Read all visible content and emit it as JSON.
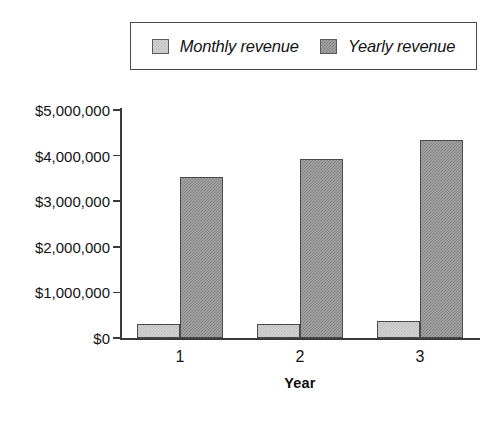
{
  "chart_data": {
    "type": "bar",
    "title": "",
    "subtitle": "",
    "xlabel": "Year",
    "ylabel": "",
    "categories": [
      "1",
      "2",
      "3"
    ],
    "series": [
      {
        "name": "Monthly revenue",
        "color": "#d2d2d2",
        "values": [
          300000,
          310000,
          370000
        ]
      },
      {
        "name": "Yearly revenue",
        "color": "#a3a3a3",
        "values": [
          3520000,
          3930000,
          4350000
        ]
      }
    ],
    "ylim": [
      0,
      5000000
    ],
    "ytick_values": [
      0,
      1000000,
      2000000,
      3000000,
      4000000,
      5000000
    ],
    "ytick_labels": [
      "$0",
      "$1,000,000",
      "$2,000,000",
      "$3,000,000",
      "$4,000,000",
      "$5,000,000"
    ],
    "grid": false,
    "legend_position": "top",
    "annotations": []
  },
  "legend": {
    "entries": [
      {
        "label": "Monthly revenue",
        "swatch_name": "legend-swatch-monthly-revenue"
      },
      {
        "label": "Yearly revenue",
        "swatch_name": "legend-swatch-yearly-revenue"
      }
    ]
  }
}
